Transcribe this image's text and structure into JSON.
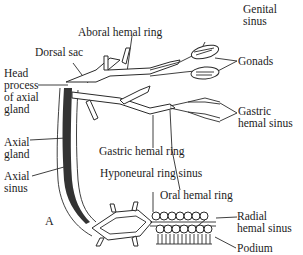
{
  "figure": {
    "panel_label": "A",
    "labels": {
      "genital_sinus": [
        "Genital",
        "sinus"
      ],
      "aboral_hemal_ring": "Aboral hemal ring",
      "dorsal_sac": "Dorsal sac",
      "gonads": "Gonads",
      "head_process": [
        "Head",
        "process",
        "of axial",
        "gland"
      ],
      "gastric_hemal_sinus": [
        "Gastric",
        "hemal sinus"
      ],
      "axial_gland": [
        "Axial",
        "gland"
      ],
      "axial_sinus": [
        "Axial",
        "sinus"
      ],
      "gastric_hemal_ring": "Gastric hemal ring",
      "hyponeural_ring_sinus": "Hyponeural ring sinus",
      "oral_hemal_ring": "Oral hemal ring",
      "radial_hemal_sinus": [
        "Radial",
        "hemal sinus"
      ],
      "podium": "Podium"
    }
  }
}
